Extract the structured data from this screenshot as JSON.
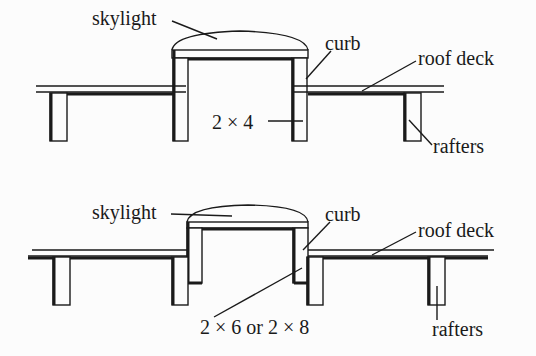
{
  "diagram": {
    "type": "cross-section",
    "top_figure": {
      "labels": {
        "skylight": "skylight",
        "curb": "curb",
        "roof_deck": "roof deck",
        "framing": "2 × 4",
        "rafters": "rafters"
      }
    },
    "bottom_figure": {
      "labels": {
        "skylight": "skylight",
        "curb": "curb",
        "roof_deck": "roof deck",
        "framing": "2 × 6 or 2 × 8",
        "rafters": "rafters"
      }
    },
    "colors": {
      "line": "#1a1a1a",
      "background": "#fcfcfc"
    }
  }
}
